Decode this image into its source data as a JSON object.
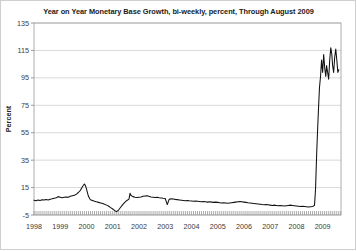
{
  "chart_data": {
    "type": "line",
    "title": "Year on Year Monetary Base Growth, bi-weekly, percent, Through August 2009",
    "xlabel": "",
    "ylabel": "Percent",
    "ylim": [
      -5,
      135
    ],
    "xlim": [
      1998.0,
      2009.7
    ],
    "yticks": [
      -5,
      15,
      35,
      55,
      75,
      95,
      115,
      135
    ],
    "ytick_labels": [
      "-5",
      "15",
      "35",
      "55",
      "75",
      "95",
      "115",
      "135"
    ],
    "xticks": [
      1998,
      1999,
      2000,
      2001,
      2002,
      2003,
      2004,
      2005,
      2006,
      2007,
      2008,
      2009
    ],
    "xtick_labels": [
      "1998",
      "1999",
      "2000",
      "2001",
      "2002",
      "2003",
      "2004",
      "2005",
      "2006",
      "2007",
      "2008",
      "2009"
    ],
    "grid": true,
    "legend": false,
    "line_color": "#111111",
    "series": [
      {
        "name": "Monetary Base Growth (YoY, %)",
        "x": [
          1998.0,
          1998.08,
          1998.15,
          1998.23,
          1998.31,
          1998.38,
          1998.46,
          1998.54,
          1998.62,
          1998.69,
          1998.77,
          1998.85,
          1998.92,
          1999.0,
          1999.08,
          1999.15,
          1999.23,
          1999.31,
          1999.38,
          1999.46,
          1999.54,
          1999.62,
          1999.69,
          1999.77,
          1999.85,
          1999.92,
          1999.96,
          2000.0,
          2000.04,
          2000.08,
          2000.12,
          2000.15,
          2000.23,
          2000.31,
          2000.38,
          2000.46,
          2000.54,
          2000.62,
          2000.69,
          2000.77,
          2000.85,
          2000.92,
          2001.0,
          2001.08,
          2001.15,
          2001.23,
          2001.31,
          2001.38,
          2001.46,
          2001.54,
          2001.62,
          2001.66,
          2001.7,
          2001.77,
          2001.85,
          2001.92,
          2002.0,
          2002.08,
          2002.15,
          2002.23,
          2002.31,
          2002.38,
          2002.46,
          2002.54,
          2002.62,
          2002.69,
          2002.77,
          2002.85,
          2002.92,
          2003.0,
          2003.08,
          2003.15,
          2003.23,
          2003.31,
          2003.38,
          2003.46,
          2003.54,
          2003.62,
          2003.69,
          2003.77,
          2003.85,
          2003.92,
          2004.0,
          2004.08,
          2004.15,
          2004.23,
          2004.31,
          2004.38,
          2004.46,
          2004.54,
          2004.62,
          2004.69,
          2004.77,
          2004.85,
          2004.92,
          2005.0,
          2005.08,
          2005.15,
          2005.23,
          2005.31,
          2005.38,
          2005.46,
          2005.54,
          2005.62,
          2005.69,
          2005.77,
          2005.85,
          2005.92,
          2006.0,
          2006.08,
          2006.15,
          2006.23,
          2006.31,
          2006.38,
          2006.46,
          2006.54,
          2006.62,
          2006.69,
          2006.77,
          2006.85,
          2006.92,
          2007.0,
          2007.08,
          2007.15,
          2007.23,
          2007.31,
          2007.38,
          2007.46,
          2007.54,
          2007.62,
          2007.69,
          2007.77,
          2007.85,
          2007.92,
          2008.0,
          2008.08,
          2008.15,
          2008.23,
          2008.31,
          2008.38,
          2008.46,
          2008.54,
          2008.62,
          2008.69,
          2008.73,
          2008.77,
          2008.81,
          2008.85,
          2008.88,
          2008.92,
          2008.96,
          2009.0,
          2009.04,
          2009.08,
          2009.12,
          2009.15,
          2009.19,
          2009.23,
          2009.27,
          2009.31,
          2009.35,
          2009.38,
          2009.42,
          2009.46,
          2009.5,
          2009.54,
          2009.58,
          2009.62
        ],
        "y": [
          5.8,
          5.4,
          5.9,
          5.6,
          6.2,
          5.9,
          6.3,
          6.0,
          6.5,
          6.8,
          7.2,
          7.6,
          8.4,
          8.0,
          7.6,
          7.9,
          8.2,
          8.0,
          8.6,
          9.0,
          9.4,
          10.2,
          11.4,
          13.0,
          15.8,
          17.6,
          16.4,
          14.0,
          11.0,
          8.4,
          7.0,
          6.2,
          5.6,
          5.0,
          4.6,
          4.2,
          3.8,
          3.4,
          2.8,
          2.2,
          1.4,
          0.4,
          -0.6,
          -1.8,
          -2.6,
          -1.2,
          0.8,
          2.6,
          4.2,
          5.6,
          6.6,
          10.8,
          9.2,
          8.4,
          8.0,
          7.8,
          8.0,
          8.2,
          8.6,
          8.8,
          9.0,
          8.6,
          8.2,
          8.0,
          7.8,
          8.0,
          7.6,
          7.4,
          7.2,
          7.0,
          2.6,
          6.4,
          6.8,
          6.6,
          6.4,
          6.2,
          6.0,
          5.8,
          5.6,
          5.4,
          5.6,
          5.4,
          5.2,
          5.0,
          5.2,
          5.0,
          4.8,
          4.6,
          4.8,
          4.6,
          4.4,
          4.6,
          4.4,
          4.2,
          4.4,
          4.2,
          4.0,
          3.8,
          4.0,
          3.8,
          3.6,
          3.8,
          4.0,
          4.2,
          4.4,
          4.6,
          4.8,
          4.6,
          4.4,
          4.2,
          4.0,
          3.8,
          3.6,
          3.4,
          3.2,
          3.0,
          2.8,
          2.6,
          2.4,
          2.6,
          2.4,
          2.2,
          2.0,
          2.2,
          2.0,
          1.8,
          2.0,
          1.8,
          1.6,
          1.8,
          2.0,
          2.2,
          2.0,
          1.8,
          1.6,
          1.4,
          1.2,
          1.4,
          1.2,
          1.0,
          0.8,
          1.0,
          1.2,
          2.0,
          14.0,
          38.0,
          58.0,
          76.0,
          88.0,
          96.0,
          108.0,
          99.0,
          112.0,
          102.0,
          96.0,
          104.0,
          99.0,
          94.0,
          108.0,
          117.0,
          112.0,
          104.0,
          99.0,
          110.0,
          116.0,
          108.0,
          99.0,
          101.0
        ]
      }
    ],
    "annotations": []
  },
  "figure": {
    "background_color": "#ffffff",
    "border_color": "#cfcfcf",
    "grid_color": "#c9c9c9",
    "frame_color": "#9a9a9a"
  }
}
